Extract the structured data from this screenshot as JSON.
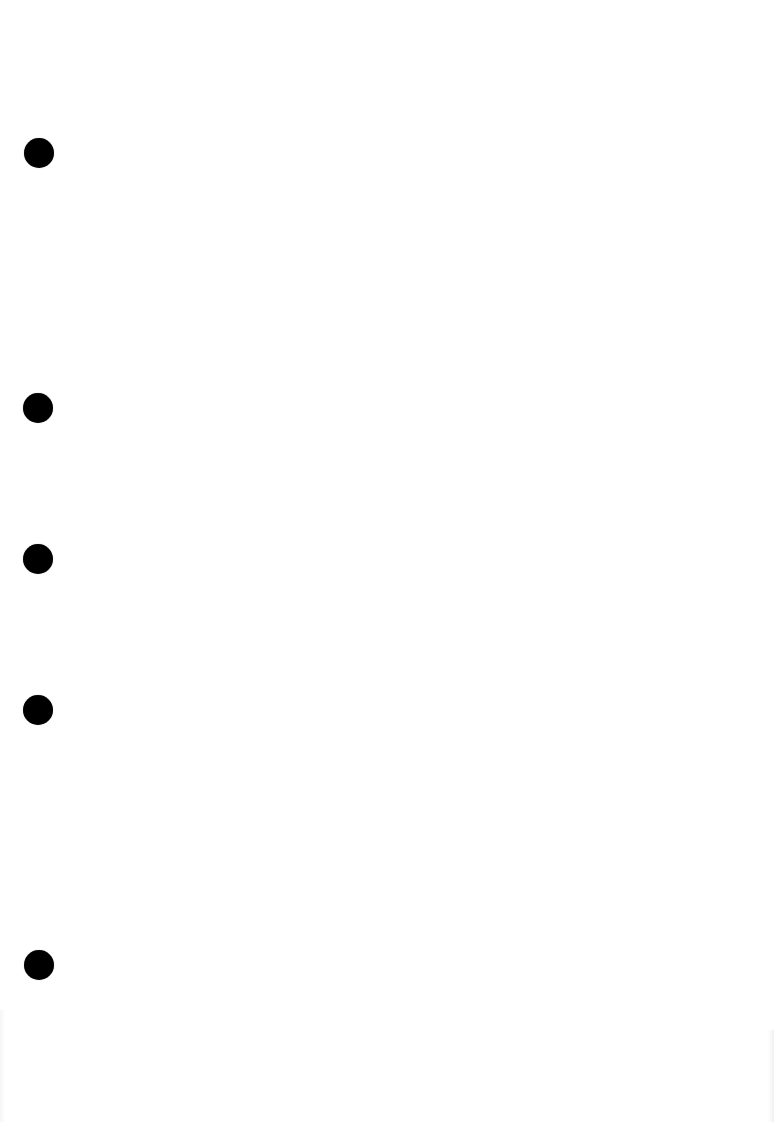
{
  "document": {
    "type": "blank-punched-page",
    "background_color": "#ffffff",
    "hole_color": "#000000",
    "punch_holes": [
      {
        "x": 39,
        "y": 153,
        "diameter": 30
      },
      {
        "x": 38,
        "y": 408,
        "diameter": 30
      },
      {
        "x": 38,
        "y": 559,
        "diameter": 30
      },
      {
        "x": 38,
        "y": 710,
        "diameter": 30
      },
      {
        "x": 39,
        "y": 965,
        "diameter": 30
      }
    ]
  }
}
